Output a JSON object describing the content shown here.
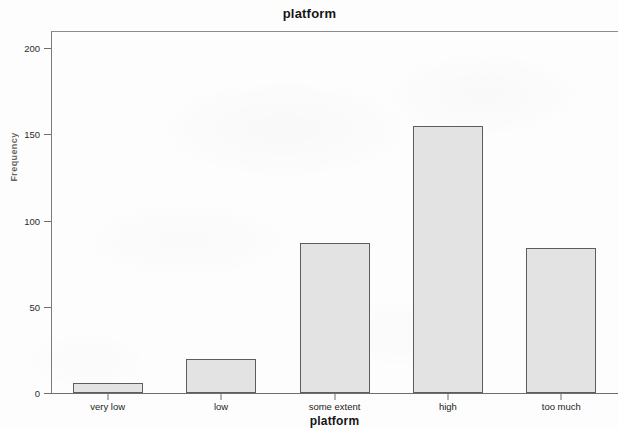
{
  "chart_data": {
    "type": "bar",
    "title": "platform",
    "xlabel": "platform",
    "ylabel": "Frequency",
    "categories": [
      "very low",
      "low",
      "some extent",
      "high",
      "too much"
    ],
    "values": [
      6,
      20,
      87,
      155,
      84
    ],
    "ylim": [
      0,
      210
    ],
    "yticks": [
      0,
      50,
      100,
      150,
      200
    ],
    "ytick_labels": [
      "0",
      "50",
      "100",
      "150",
      "200"
    ],
    "grid": false,
    "legend": null,
    "legend_position": "none",
    "bar_fill_color": "#e3e3e3",
    "bar_border_color": "#5d5d5d",
    "background_color": "#fdfdfd",
    "axis_color": "#6e6e6e"
  }
}
